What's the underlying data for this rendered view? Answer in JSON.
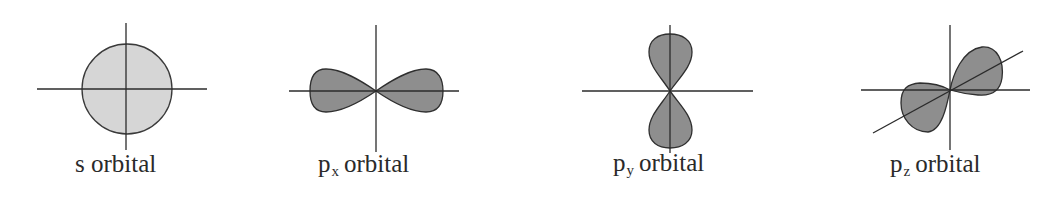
{
  "figure": {
    "colors": {
      "s_fill": "#d6d6d6",
      "p_fill": "#8e8e8e",
      "stroke": "#2f2f2f",
      "axis": "#2b2b2b",
      "text": "#2a2a2a"
    },
    "orbitals": [
      {
        "id": "s",
        "prefix": "s",
        "subscript": "",
        "suffix": "orbital",
        "shape": "sphere"
      },
      {
        "id": "px",
        "prefix": "p",
        "subscript": "x",
        "suffix": "orbital",
        "shape": "dumbbell-horizontal"
      },
      {
        "id": "py",
        "prefix": "p",
        "subscript": "y",
        "suffix": "orbital",
        "shape": "dumbbell-vertical"
      },
      {
        "id": "pz",
        "prefix": "p",
        "subscript": "z",
        "suffix": "orbital",
        "shape": "dumbbell-diagonal"
      }
    ]
  }
}
